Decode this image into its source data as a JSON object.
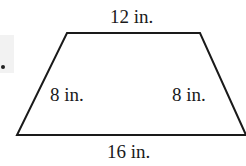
{
  "figure": {
    "shape": "isosceles-trapezoid",
    "labels": {
      "top": "12 in.",
      "left": "8 in.",
      "right": "8 in.",
      "bottom": "16 in."
    },
    "stroke_color": "#1a1a1a"
  }
}
